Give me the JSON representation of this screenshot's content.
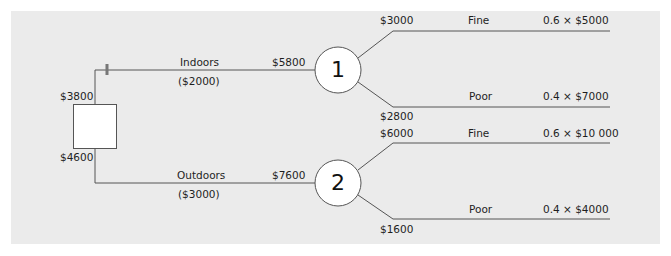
{
  "colors": {
    "panel_background": "#ebebeb",
    "line": "#555555",
    "node_fill": "#ffffff",
    "text": "#1e1e1e"
  },
  "decision_node": {
    "upper_value": "$3800",
    "lower_value": "$4600"
  },
  "alternatives": [
    {
      "name": "Indoors",
      "cost": "($2000)",
      "expected_value": "$5800",
      "chance_node_label": "1",
      "outcomes": [
        {
          "name": "Fine",
          "value": "$3000",
          "calc": "0.6 × $5000"
        },
        {
          "name": "Poor",
          "value": "$2800",
          "calc": "0.4 × $7000"
        }
      ]
    },
    {
      "name": "Outdoors",
      "cost": "($3000)",
      "expected_value": "$7600",
      "chance_node_label": "2",
      "outcomes": [
        {
          "name": "Fine",
          "value": "$6000",
          "calc": "0.6 × $10 000"
        },
        {
          "name": "Poor",
          "value": "$1600",
          "calc": "0.4 × $4000"
        }
      ]
    }
  ]
}
